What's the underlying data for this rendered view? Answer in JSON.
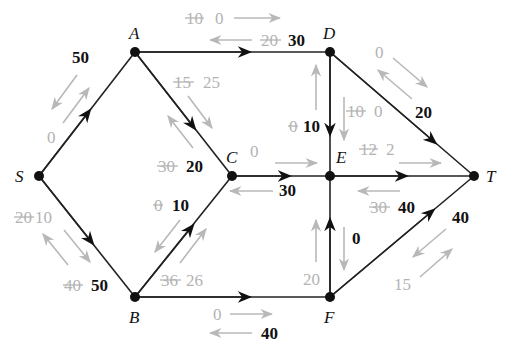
{
  "diagram": {
    "type": "residual-network-flow",
    "nodes": {
      "S": {
        "label": "S",
        "x": 39,
        "y": 176
      },
      "A": {
        "label": "A",
        "x": 135,
        "y": 52
      },
      "D": {
        "label": "D",
        "x": 330,
        "y": 52
      },
      "C": {
        "label": "C",
        "x": 232,
        "y": 176
      },
      "E": {
        "label": "E",
        "x": 330,
        "y": 176
      },
      "T": {
        "label": "T",
        "x": 474,
        "y": 176
      },
      "B": {
        "label": "B",
        "x": 135,
        "y": 297
      },
      "F": {
        "label": "F",
        "x": 330,
        "y": 297
      }
    },
    "edges": [
      {
        "from": "S",
        "to": "A",
        "forward_residual": "0",
        "backward_residual": "50"
      },
      {
        "from": "S",
        "to": "B",
        "forward_residual_old": "20",
        "forward_residual": "10",
        "backward_residual_old": "40",
        "backward_residual": "50"
      },
      {
        "from": "A",
        "to": "D",
        "forward_residual_old": "10",
        "forward_residual": "0",
        "backward_residual_old": "20",
        "backward_residual": "30"
      },
      {
        "from": "A",
        "to": "C",
        "forward_residual_old": "15",
        "forward_residual": "25",
        "backward_residual_old": "30",
        "backward_residual": "20"
      },
      {
        "from": "B",
        "to": "C",
        "forward_residual_old": "36",
        "forward_residual": "26",
        "backward_residual_old": "0",
        "backward_residual": "10"
      },
      {
        "from": "B",
        "to": "F",
        "forward_residual": "0",
        "backward_residual": "40"
      },
      {
        "from": "C",
        "to": "E",
        "forward_residual": "0",
        "backward_residual": "30"
      },
      {
        "from": "D",
        "to": "E",
        "forward_residual_old": "10",
        "forward_residual": "0",
        "backward_residual_old": "0",
        "backward_residual": "10"
      },
      {
        "from": "D",
        "to": "T",
        "forward_residual": "0",
        "backward_residual": "20"
      },
      {
        "from": "E",
        "to": "T",
        "forward_residual_old": "12",
        "forward_residual": "2",
        "backward_residual_old": "30",
        "backward_residual": "40"
      },
      {
        "from": "F",
        "to": "E",
        "forward_residual": "20",
        "backward_residual": "0"
      },
      {
        "from": "F",
        "to": "T",
        "forward_residual": "15",
        "backward_residual": "40"
      }
    ]
  },
  "labels": {
    "S": "S",
    "A": "A",
    "B": "B",
    "C": "C",
    "D": "D",
    "E": "E",
    "F": "F",
    "T": "T",
    "sa_back": "50",
    "sa_fwd": "0",
    "sb_fwd_old": "20",
    "sb_fwd": "10",
    "sb_back_old": "40",
    "sb_back": "50",
    "ad_fwd_old": "10",
    "ad_fwd": "0",
    "ad_back_old": "20",
    "ad_back": "30",
    "ac_fwd_old": "15",
    "ac_fwd": "25",
    "ac_back_old": "30",
    "ac_back": "20",
    "bc_back_old": "0",
    "bc_back": "10",
    "bc_fwd_old": "36",
    "bc_fwd": "26",
    "bf_fwd": "0",
    "bf_back": "40",
    "ce_fwd": "0",
    "ce_back": "30",
    "de_back_old": "0",
    "de_back": "10",
    "de_fwd_old": "10",
    "de_fwd": "0",
    "dt_fwd": "0",
    "dt_back": "20",
    "et_fwd_old": "12",
    "et_fwd": "2",
    "et_back_old": "30",
    "et_back": "40",
    "fe_fwd": "20",
    "fe_back": "0",
    "ft_back": "40",
    "ft_fwd": "15"
  }
}
